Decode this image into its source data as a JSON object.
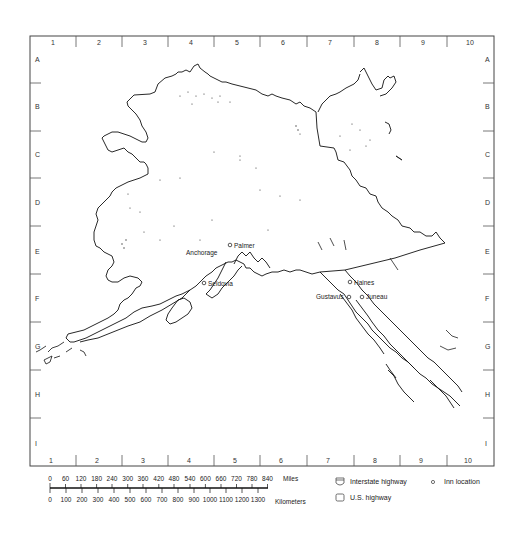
{
  "map": {
    "region": "Alaska",
    "frame": {
      "left": 30,
      "top": 36,
      "right": 494,
      "bottom": 466
    },
    "columns": [
      "1",
      "2",
      "3",
      "4",
      "5",
      "6",
      "7",
      "8",
      "9",
      "10"
    ],
    "rows": [
      "A",
      "B",
      "C",
      "D",
      "E",
      "F",
      "G",
      "H",
      "I"
    ],
    "cities": [
      {
        "name": "Anchorage",
        "x": 226,
        "y": 253,
        "label_x": 186,
        "label_y": 255,
        "symbol": false
      },
      {
        "name": "Palmer",
        "x": 230,
        "y": 245,
        "label_x": 234,
        "label_y": 248,
        "symbol": true
      },
      {
        "name": "Seldovia",
        "x": 204,
        "y": 283,
        "label_x": 208,
        "label_y": 286,
        "symbol": true
      },
      {
        "name": "Haines",
        "x": 350,
        "y": 282,
        "label_x": 354,
        "label_y": 285,
        "symbol": true
      },
      {
        "name": "Gustavus",
        "x": 349,
        "y": 297,
        "label_x": 316,
        "label_y": 299,
        "symbol": true
      },
      {
        "name": "Juneau",
        "x": 362,
        "y": 297,
        "label_x": 366,
        "label_y": 299,
        "symbol": true
      }
    ]
  },
  "scale": {
    "miles_label": "Miles",
    "kilometers_label": "Kilometers",
    "miles_ticks": [
      "0",
      "60",
      "120",
      "180",
      "240",
      "300",
      "360",
      "420",
      "480",
      "540",
      "600",
      "660",
      "720",
      "780",
      "840"
    ],
    "km_ticks": [
      "0",
      "100",
      "200",
      "300",
      "400",
      "500",
      "600",
      "700",
      "800",
      "900",
      "1000",
      "1100",
      "1200",
      "1300"
    ]
  },
  "legend": {
    "interstate": {
      "icon": "interstate-shield-icon",
      "label": "Interstate highway"
    },
    "us_highway": {
      "icon": "us-highway-shield-icon",
      "label": "U.S. highway"
    },
    "inn": {
      "icon": "circle-icon",
      "label": "Inn location"
    }
  },
  "colors": {
    "line": "#111111",
    "frame": "#444444",
    "text": "#222222"
  }
}
